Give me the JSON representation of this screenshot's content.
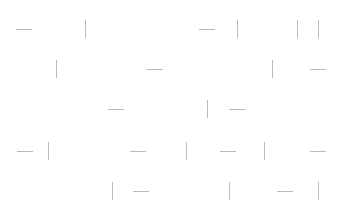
{
  "canvas": {
    "width": 341,
    "height": 218,
    "background": "#ffffff"
  },
  "style": {
    "segment_color": "#b9b9b9",
    "segment_thickness": 1
  },
  "segments": [
    {
      "orient": "h",
      "x": 16,
      "y": 29,
      "len": 16
    },
    {
      "orient": "v",
      "x": 85,
      "y": 20,
      "len": 18
    },
    {
      "orient": "h",
      "x": 199,
      "y": 29,
      "len": 16
    },
    {
      "orient": "v",
      "x": 237,
      "y": 20,
      "len": 18
    },
    {
      "orient": "v",
      "x": 297,
      "y": 20,
      "len": 18
    },
    {
      "orient": "v",
      "x": 318,
      "y": 20,
      "len": 18
    },
    {
      "orient": "v",
      "x": 56,
      "y": 60,
      "len": 18
    },
    {
      "orient": "h",
      "x": 147,
      "y": 69,
      "len": 16
    },
    {
      "orient": "v",
      "x": 272,
      "y": 60,
      "len": 18
    },
    {
      "orient": "h",
      "x": 310,
      "y": 69,
      "len": 16
    },
    {
      "orient": "h",
      "x": 108,
      "y": 109,
      "len": 16
    },
    {
      "orient": "v",
      "x": 207,
      "y": 100,
      "len": 18
    },
    {
      "orient": "h",
      "x": 229,
      "y": 109,
      "len": 16
    },
    {
      "orient": "h",
      "x": 17,
      "y": 151,
      "len": 16
    },
    {
      "orient": "v",
      "x": 48,
      "y": 142,
      "len": 18
    },
    {
      "orient": "h",
      "x": 130,
      "y": 151,
      "len": 16
    },
    {
      "orient": "v",
      "x": 186,
      "y": 142,
      "len": 18
    },
    {
      "orient": "h",
      "x": 220,
      "y": 151,
      "len": 16
    },
    {
      "orient": "v",
      "x": 264,
      "y": 142,
      "len": 18
    },
    {
      "orient": "h",
      "x": 310,
      "y": 151,
      "len": 16
    },
    {
      "orient": "v",
      "x": 112,
      "y": 182,
      "len": 18
    },
    {
      "orient": "h",
      "x": 133,
      "y": 191,
      "len": 16
    },
    {
      "orient": "v",
      "x": 229,
      "y": 182,
      "len": 18
    },
    {
      "orient": "h",
      "x": 277,
      "y": 191,
      "len": 16
    },
    {
      "orient": "v",
      "x": 318,
      "y": 182,
      "len": 18
    }
  ]
}
